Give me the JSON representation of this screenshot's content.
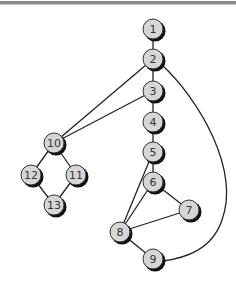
{
  "diagram": {
    "type": "control-flow-graph",
    "node_fill": "#d6d6d6",
    "edge_color": "#222222",
    "nodes": [
      {
        "id": "1",
        "label": "1",
        "x": 153,
        "y": 29
      },
      {
        "id": "2",
        "label": "2",
        "x": 153,
        "y": 59
      },
      {
        "id": "3",
        "label": "3",
        "x": 153,
        "y": 91
      },
      {
        "id": "4",
        "label": "4",
        "x": 153,
        "y": 122
      },
      {
        "id": "5",
        "label": "5",
        "x": 153,
        "y": 152
      },
      {
        "id": "6",
        "label": "6",
        "x": 153,
        "y": 182
      },
      {
        "id": "7",
        "label": "7",
        "x": 189,
        "y": 210
      },
      {
        "id": "8",
        "label": "8",
        "x": 120,
        "y": 232
      },
      {
        "id": "9",
        "label": "9",
        "x": 153,
        "y": 259
      },
      {
        "id": "10",
        "label": "10",
        "x": 54,
        "y": 143
      },
      {
        "id": "11",
        "label": "11",
        "x": 76,
        "y": 175
      },
      {
        "id": "12",
        "label": "12",
        "x": 31,
        "y": 175
      },
      {
        "id": "13",
        "label": "13",
        "x": 54,
        "y": 205
      }
    ],
    "edges": [
      [
        "1",
        "2"
      ],
      [
        "2",
        "3"
      ],
      [
        "3",
        "4"
      ],
      [
        "4",
        "5"
      ],
      [
        "5",
        "6"
      ],
      [
        "6",
        "7"
      ],
      [
        "6",
        "8"
      ],
      [
        "5",
        "8"
      ],
      [
        "7",
        "8"
      ],
      [
        "8",
        "9"
      ],
      [
        "2",
        "10"
      ],
      [
        "3",
        "10"
      ],
      [
        "10",
        "12"
      ],
      [
        "10",
        "11"
      ],
      [
        "12",
        "13"
      ],
      [
        "11",
        "13"
      ],
      [
        "2",
        "9"
      ]
    ]
  }
}
